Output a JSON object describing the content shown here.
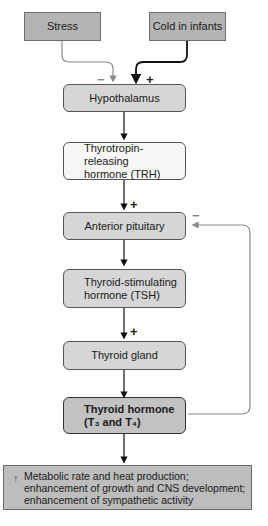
{
  "inputs": {
    "stress": "Stress",
    "cold": "Cold in infants"
  },
  "nodes": {
    "hypothalamus": "Hypothalamus",
    "trh_line1": "Thyrotropin-releasing",
    "trh_line2": "hormone (TRH)",
    "anterior_pituitary": "Anterior pituitary",
    "tsh_line1": "Thyroid-stimulating",
    "tsh_line2": "hormone (TSH)",
    "thyroid_gland": "Thyroid gland",
    "thyroid_hormone_line1": "Thyroid hormone",
    "thyroid_hormone_line2": "(T₃ and T₄)"
  },
  "signs": {
    "stress_effect": "−",
    "cold_effect": "+",
    "trh_effect": "+",
    "feedback_effect": "−",
    "tsh_effect": "+"
  },
  "effects": {
    "arrow": "↑",
    "line1": "Metabolic rate and heat production;",
    "line2": "enhancement of growth and CNS development;",
    "line3": "enhancement of sympathetic activity"
  },
  "colors": {
    "input_fill": "#b4b4b4",
    "node_light": "#f6f6f6",
    "node_mid": "#d6d6d6",
    "node_dark": "#c2c2c2",
    "inhibitory_line": "#8a8a8a",
    "stimulatory_line": "#111111"
  }
}
